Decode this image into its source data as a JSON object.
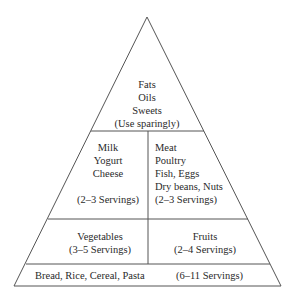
{
  "top": {
    "lines": [
      "Fats",
      "Oils",
      "Sweets",
      "(Use sparingly)"
    ]
  },
  "tier2": {
    "left": {
      "lines": [
        "Milk",
        "Yogurt",
        "Cheese"
      ],
      "servings": "(2–3 Servings)"
    },
    "right": {
      "lines": [
        "Meat",
        "Poultry",
        "Fish, Eggs",
        "Dry beans, Nuts"
      ],
      "servings": "(2–3 Servings)"
    }
  },
  "tier3": {
    "left": {
      "label": "Vegetables",
      "servings": "(3–5 Servings)"
    },
    "right": {
      "label": "Fruits",
      "servings": "(2–4 Servings)"
    }
  },
  "base": {
    "label": "Bread, Rice, Cereal, Pasta",
    "servings": "(6–11 Servings)"
  },
  "colors": {
    "line": "#555555",
    "text": "#2a2a2a",
    "background": "#ffffff"
  }
}
